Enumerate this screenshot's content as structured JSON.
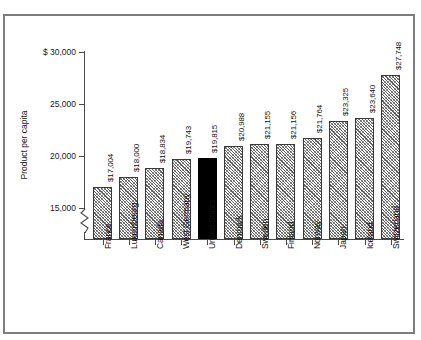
{
  "figure": {
    "clipped_title": "",
    "border_color": "#7d7d7d",
    "background": "#ffffff"
  },
  "axis": {
    "y_title": "Product per capita",
    "tick_labels": [
      "$ 30,000",
      "25,000",
      "20,000",
      "15,000"
    ],
    "break_symbol": "zigzag-axis-break"
  },
  "chart_data": {
    "type": "bar",
    "title": "",
    "xlabel": "",
    "ylabel": "Product per capita",
    "ylim": [
      13000,
      30000
    ],
    "yticks": [
      15000,
      20000,
      25000,
      30000
    ],
    "ytick_labels": [
      "15,000",
      "20,000",
      "25,000",
      "$ 30,000"
    ],
    "grid": false,
    "legend": "none",
    "axis_break": true,
    "highlight_category": "United States",
    "highlight_color": "#000000",
    "bar_fill": "hatched-gray",
    "categories": [
      "France",
      "Luxembourg",
      "Canada",
      "West Germany",
      "United States",
      "Denmark",
      "Sweden",
      "Finland",
      "Norway",
      "Japan",
      "Iceland",
      "Switzerland"
    ],
    "values": [
      17004,
      18000,
      18834,
      19743,
      19815,
      20988,
      21155,
      21156,
      21764,
      23325,
      23640,
      27748
    ],
    "value_labels": [
      "$17,004",
      "$18,000",
      "$18,834",
      "$19,743",
      "$19,815",
      "$20,988",
      "$21,155",
      "$21,156",
      "$21,764",
      "$23,325",
      "$23,640",
      "$27,748"
    ]
  }
}
